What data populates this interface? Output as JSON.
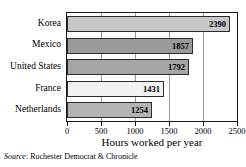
{
  "chart_data": {
    "type": "bar",
    "orientation": "horizontal",
    "title": "",
    "xlabel": "Hours worked per year",
    "ylabel": "",
    "categories": [
      "Korea",
      "Mexico",
      "United States",
      "France",
      "Netherlands"
    ],
    "values": [
      2390,
      1857,
      1792,
      1431,
      1254
    ],
    "value_labels": [
      "2390",
      "1857",
      "1792",
      "1431",
      "1254"
    ],
    "bar_colors": [
      "#c8c8c8",
      "#9a9a9a",
      "#a5a5a5",
      "#f2f2f2",
      "#b4b4b4"
    ],
    "xlim": [
      0,
      2500
    ],
    "xticks": [
      0,
      500,
      1000,
      1500,
      2000,
      2500
    ],
    "xtick_labels": [
      "0",
      "500",
      "1000",
      "1500",
      "2000",
      "2500"
    ],
    "grid": true,
    "grid_axis": "x",
    "legend": false,
    "legend_position": "none",
    "plot_border_color": "#1a1a1a",
    "gridline_color": "#9a9a9a"
  },
  "source": {
    "label": "Source",
    "separator": ": ",
    "text": "Rochester Democrat & Chronicle"
  }
}
